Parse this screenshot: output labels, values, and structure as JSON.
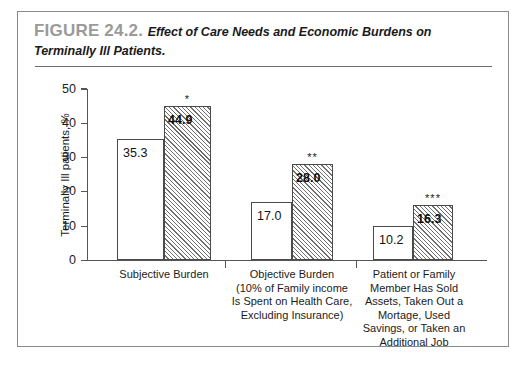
{
  "figure": {
    "number": "FIGURE 24.2.",
    "caption": "Effect of Care Needs and Economic Burdens on Terminally Ill Patients."
  },
  "chart_data": {
    "type": "bar",
    "title": "Effect of Care Needs and Economic Burdens on Terminally Ill Patients.",
    "xlabel": "",
    "ylabel": "Terminally Ill patients, %",
    "ylim": [
      0,
      50
    ],
    "yticks": [
      0,
      10,
      20,
      30,
      40,
      50
    ],
    "ytick_labels": [
      "0",
      "10",
      "20",
      "30",
      "40",
      "50"
    ],
    "grid": false,
    "legend": "none",
    "categories": [
      "Subjective Burden",
      "Objective Burden (10% of Family income Is Spent on Health Care, Excluding Insurance)",
      "Patient or Family Member Has Sold Assets, Taken Out a Mortage, Used Savings, or Taken an Additional Job"
    ],
    "category_label_lines": [
      [
        "Subjective Burden"
      ],
      [
        "Objective Burden",
        "(10% of Family income",
        "Is Spent on Health Care,",
        "Excluding Insurance)"
      ],
      [
        "Patient or Family",
        "Member Has Sold",
        "Assets, Taken Out a",
        "Mortage, Used",
        "Savings, or Taken an",
        "Additional Job"
      ]
    ],
    "series": [
      {
        "name": "plain",
        "fill": "white",
        "values": [
          35.3,
          17.0,
          10.2
        ],
        "value_labels": [
          "35.3",
          "17.0",
          "10.2"
        ]
      },
      {
        "name": "hatched",
        "fill": "diagonal-hatch",
        "values": [
          44.9,
          28.0,
          16.3
        ],
        "value_labels": [
          "44.9",
          "28.0",
          "16.3"
        ],
        "significance_marks": [
          "*",
          "**",
          "***"
        ]
      }
    ],
    "colors": {
      "axis": "#555555",
      "bar_outline": "#4a4a4a",
      "hatch": "#6e6e6e",
      "text": "#1b1b1b",
      "figure_number": "#9a9a9a",
      "frame": "#8a8a8a"
    }
  },
  "geometry": {
    "group_ticks_x": [
      207,
      338
    ],
    "groups": [
      {
        "plain_left": 99,
        "plain_width": 47,
        "hatch_left": 146,
        "hatch_width": 47,
        "label_left": 66,
        "label_top": 256,
        "label_width": 160
      },
      {
        "plain_left": 233,
        "plain_width": 41,
        "hatch_left": 274,
        "hatch_width": 41,
        "label_left": 196,
        "label_top": 256,
        "label_width": 156
      },
      {
        "plain_left": 355,
        "plain_width": 40,
        "hatch_left": 395,
        "hatch_width": 40,
        "label_left": 320,
        "label_top": 256,
        "label_width": 152
      }
    ]
  }
}
